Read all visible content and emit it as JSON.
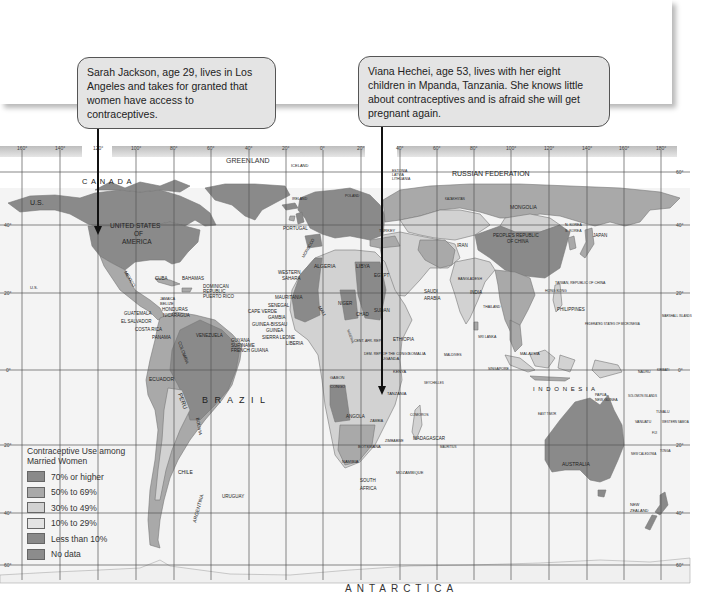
{
  "callouts": [
    {
      "text": "Sarah Jackson, age 29, lives in Los Angeles and takes for granted that women have access to contraceptives.",
      "points_to": "Los Angeles"
    },
    {
      "text": "Viana Hechei, age 53, lives with her eight children in Mpanda, Tanzania. She knows little about contraceptives and is afraid she will get pregnant again.",
      "points_to": "Mpanda, Tanzania"
    }
  ],
  "map": {
    "longitude_labels": [
      "160°",
      "140°",
      "120°",
      "100°",
      "80°",
      "60°",
      "40°",
      "20°",
      "0°",
      "20°",
      "40°",
      "60°",
      "80°",
      "100°",
      "120°",
      "140°",
      "160°",
      "180°"
    ],
    "latitude_labels": [
      "60°",
      "40°",
      "20°",
      "0°",
      "20°",
      "40°",
      "60°"
    ],
    "labels": {
      "canada": "C A N A D A",
      "us_alaska": "U.S.",
      "greenland": "GREENLAND",
      "iceland": "ICELAND",
      "russia": "RUSSIAN   FEDERATION",
      "usa_line1": "UNITED STATES",
      "usa_line2": "OF",
      "usa_line3": "AMERICA",
      "us_hawaii": "U.S.",
      "mexico": "MEXICO",
      "cuba": "CUBA",
      "bahamas": "BAHAMAS",
      "dominican": "DOMINICAN",
      "republic": "REPUBLIC",
      "puerto_rico": "PUERTO RICO",
      "jamaica": "JAMAICA",
      "belize": "BELIZE",
      "honduras": "HONDURAS",
      "guatemala": "GUATEMALA",
      "nicaragua": "NICARAGUA",
      "el_salvador": "EL SALVADOR",
      "costa_rica": "COSTA RICA",
      "panama": "PANAMA",
      "venezuela": "VENEZUELA",
      "guyana": "GUYANA",
      "suriname": "SURINAME",
      "french_guiana": "FRENCH GUIANA",
      "colombia": "COLOMBIA",
      "ecuador": "ECUADOR",
      "peru": "PERU",
      "brazil": "B R A Z I L",
      "bolivia": "BOLIVIA",
      "chile": "CHILE",
      "argentina": "ARGENTINA",
      "uruguay": "URUGUAY",
      "portugal": "PORTUGAL",
      "ireland": "IRELAND",
      "poland": "POLAND",
      "estonia": "ESTONIA",
      "latvia": "LATVIA",
      "lithuania": "LITHUANIA",
      "turkey": "TURKEY",
      "morocco": "MOROCCO",
      "algeria": "ALGERIA",
      "libya": "LIBYA",
      "egypt": "EGYPT",
      "western_sahara_1": "WESTERN",
      "western_sahara_2": "SAHARA",
      "mauritania": "MAURITANIA",
      "mali": "MALI",
      "niger": "NIGER",
      "chad": "CHAD",
      "sudan": "SUDAN",
      "senegal": "SENEGAL",
      "cape_verde": "CAPE VERDE",
      "gambia": "GAMBIA",
      "guinea_bissau": "GUINEA-BISSAU",
      "guinea": "GUINEA",
      "sierra_leone": "SIERRA LEONE",
      "liberia": "LIBERIA",
      "nigeria": "NIGERIA",
      "ethiopia": "ETHIOPIA",
      "somalia": "SOMALIA",
      "cent_afr": "CENT. AFR. REP.",
      "dem_rep_congo": "DEM. REP. OF THE CONGO",
      "gabon": "GABON",
      "congo": "CONGO",
      "uganda": "UGANDA",
      "kenya": "KENYA",
      "tanzania": "TANZANIA",
      "angola": "ANGOLA",
      "zambia": "ZAMBIA",
      "zimbabwe": "ZIMBABWE",
      "namibia": "NAMIBIA",
      "botswana": "BOTSWANA",
      "mozambique": "MOZAMBIQUE",
      "south_africa_1": "SOUTH",
      "south_africa_2": "AFRICA",
      "madagascar": "MADAGASCAR",
      "comoros": "COMOROS",
      "seychelles": "SEYCHELLES",
      "mauritius": "MAURITIUS",
      "saudi_1": "SAUDI",
      "saudi_2": "ARABIA",
      "iran": "IRAN",
      "kazakhstan": "KAZAKHSTAN",
      "mongolia": "MONGOLIA",
      "china_1": "PEOPLE'S REPUBLIC",
      "china_2": "OF CHINA",
      "korea_n": "N. KOREA",
      "korea_s": "S. KOREA",
      "japan": "JAPAN",
      "india": "INDIA",
      "sri_lanka": "SRI LANKA",
      "maldives": "MALDIVES",
      "bangladesh": "BANGLADESH",
      "thailand": "THAILAND",
      "taiwan": "TAIWAN, REPUBLIC OF CHINA",
      "hong_kong": "HONG KONG",
      "philippines": "PHILIPPINES",
      "malaysia": "MALAYSIA",
      "singapore": "SINGAPORE",
      "indonesia": "I N D O N E S I A",
      "east_timor": "EAST TIMOR",
      "png_1": "PAPUA",
      "png_2": "NEW GUINEA",
      "micronesia": "FEDERATED STATES OF MICRONESIA",
      "marshall": "MARSHALL ISLANDS",
      "nauru": "NAURU",
      "kiribati": "KIRIBATI",
      "solomon": "SOLOMON ISLANDS",
      "vanuatu": "VANUATU",
      "tuvalu": "TUVALU",
      "samoa": "WESTERN SAMOA",
      "fiji": "FIJI",
      "tonga": "TONGA",
      "new_caledonia": "NEW CALEDONIA",
      "australia": "AUSTRALIA",
      "nz_1": "NEW",
      "nz_2": "ZEALAND",
      "antarctica": "ANTARCTICA"
    }
  },
  "legend": {
    "title_line1": "Contraceptive Use among",
    "title_line2": "Married Women",
    "items": [
      {
        "label": "70% or higher",
        "color": "#8a8a8a"
      },
      {
        "label": "50% to 69%",
        "color": "#a9a9a9"
      },
      {
        "label": "30% to 49%",
        "color": "#d2d2d2"
      },
      {
        "label": "10% to 29%",
        "color": "#e3e3e3"
      },
      {
        "label": "Less than 10%",
        "color": "#898989"
      },
      {
        "label": "No data",
        "color": "#8c8c8c"
      }
    ]
  },
  "colors": {
    "ocean": "#f4f4f4",
    "grid": "#555555",
    "high": "#8a8a8a",
    "mid": "#a9a9a9",
    "low": "#d2d2d2",
    "vlow": "#e3e3e3"
  }
}
